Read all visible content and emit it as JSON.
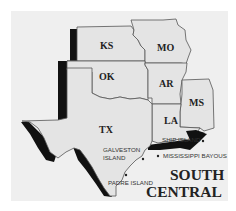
{
  "map": {
    "title_line1": "SOUTH",
    "title_line2": "CENTRAL",
    "states": [
      {
        "abbr": "KS"
      },
      {
        "abbr": "MO"
      },
      {
        "abbr": "OK"
      },
      {
        "abbr": "AR"
      },
      {
        "abbr": "MS"
      },
      {
        "abbr": "LA"
      },
      {
        "abbr": "TX"
      }
    ],
    "locations": [
      {
        "name_line1": "GALVESTON",
        "name_line2": "ISLAND"
      },
      {
        "name": "PADRE ISLAND"
      },
      {
        "name": "SHIP ISLAND"
      },
      {
        "name": "MISSISSIPPI BAYOUS"
      }
    ],
    "colors": {
      "background": "#efefef",
      "state_fill": "#e4e4e4",
      "outline": "#555555",
      "shadow": "#111111"
    }
  }
}
